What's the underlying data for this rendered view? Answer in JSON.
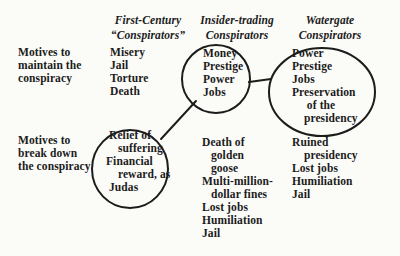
{
  "colors": {
    "ink": "#1c1c1c",
    "background": "#fbfbf8"
  },
  "row_labels": {
    "maintain": [
      "Motives to",
      "maintain the",
      "conspiracy"
    ],
    "breakdown": [
      "Motives to",
      "break down",
      "the conspiracy"
    ]
  },
  "columns": {
    "first_century": {
      "header": [
        "First-Century",
        "“Conspirators”"
      ],
      "maintain_motives": [
        "Misery",
        "Jail",
        "Torture",
        "Death"
      ],
      "breakdown_motives": [
        " Relief of",
        "    suffering",
        "Financial",
        "    reward, as",
        " Judas"
      ]
    },
    "insider_trading": {
      "header": [
        "Insider-trading",
        "Conspirators"
      ],
      "maintain_motives": [
        "Money",
        "Prestige",
        "Power",
        "Jobs"
      ],
      "breakdown_motives": [
        "Death of",
        "   golden",
        "   goose",
        "Multi-million-",
        "   dollar fines",
        "Lost jobs",
        "Humiliation",
        "Jail"
      ]
    },
    "watergate": {
      "header": [
        "Watergate",
        "Conspirators"
      ],
      "maintain_motives": [
        "Power",
        "Prestige",
        "Jobs",
        "Preservation",
        "     of the",
        "    presidency"
      ],
      "breakdown_motives": [
        "Ruined",
        "    presidency",
        "Lost jobs",
        "Humiliation",
        "Jail"
      ]
    }
  }
}
